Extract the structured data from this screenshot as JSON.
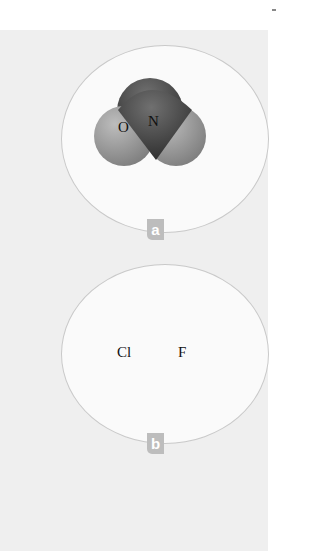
{
  "figure": {
    "panels": [
      {
        "label": "a",
        "molecule": "NO",
        "atoms": [
          {
            "symbol": "O",
            "color": "#9a9a9a"
          },
          {
            "symbol": "N",
            "color": "#4a4a4a"
          }
        ]
      },
      {
        "label": "b",
        "molecule": "ClF",
        "atoms": [
          {
            "symbol": "Cl",
            "color": "#6e6e6e"
          },
          {
            "symbol": "F",
            "color": "#8c8c8c"
          }
        ]
      }
    ]
  }
}
